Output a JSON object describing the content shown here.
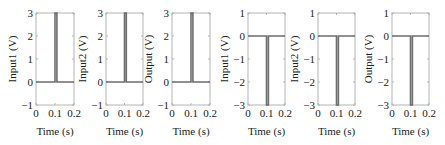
{
  "chart_data": [
    {
      "type": "line",
      "title": "",
      "xlabel": "Time (s)",
      "ylabel": "Input1 (V)",
      "xlim": [
        0,
        0.2
      ],
      "ylim": [
        -1,
        3
      ],
      "xticks": [
        "0",
        "0.1",
        "0.2"
      ],
      "yticks": [
        "-1",
        "0",
        "1",
        "2",
        "3"
      ],
      "x": [
        0,
        0.1,
        0.1,
        0.11,
        0.11,
        0.2
      ],
      "y": [
        0,
        0,
        3,
        3,
        0,
        0
      ],
      "grid": false,
      "box": {
        "left": 36,
        "right": 74
      }
    },
    {
      "type": "line",
      "title": "",
      "xlabel": "Time (s)",
      "ylabel": "Input2 (V)",
      "xlim": [
        0,
        0.2
      ],
      "ylim": [
        -1,
        3
      ],
      "xticks": [
        "0",
        "0.1",
        "0.2"
      ],
      "yticks": [
        "-1",
        "0",
        "1",
        "2",
        "3"
      ],
      "x": [
        0,
        0.1,
        0.1,
        0.11,
        0.11,
        0.2
      ],
      "y": [
        0,
        0,
        3,
        3,
        0,
        0
      ],
      "grid": false,
      "box": {
        "left": 106,
        "right": 143
      }
    },
    {
      "type": "line",
      "title": "",
      "xlabel": "Time (s)",
      "ylabel": "Output (V)",
      "xlim": [
        0,
        0.2
      ],
      "ylim": [
        -1,
        3
      ],
      "xticks": [
        "0",
        "0.1",
        "0.2"
      ],
      "yticks": [
        "-1",
        "0",
        "1",
        "2",
        "3"
      ],
      "x": [
        0,
        0.1,
        0.1,
        0.11,
        0.11,
        0.2
      ],
      "y": [
        0,
        0,
        3,
        3,
        0,
        0
      ],
      "grid": false,
      "box": {
        "left": 172,
        "right": 210
      }
    },
    {
      "type": "line",
      "title": "",
      "xlabel": "Time (s)",
      "ylabel": "Input1 (V)",
      "xlim": [
        0,
        0.2
      ],
      "ylim": [
        -3,
        1
      ],
      "xticks": [
        "0",
        "0.1",
        "0.2"
      ],
      "yticks": [
        "-3",
        "-2",
        "-1",
        "0",
        "1"
      ],
      "x": [
        0,
        0.1,
        0.1,
        0.11,
        0.11,
        0.2
      ],
      "y": [
        0,
        0,
        -3,
        -3,
        0,
        0
      ],
      "grid": false,
      "box": {
        "left": 248,
        "right": 285
      }
    },
    {
      "type": "line",
      "title": "",
      "xlabel": "Time (s)",
      "ylabel": "Input2 (V)",
      "xlim": [
        0,
        0.2
      ],
      "ylim": [
        -3,
        1
      ],
      "xticks": [
        "0",
        "0.1",
        "0.2"
      ],
      "yticks": [
        "-3",
        "-2",
        "-1",
        "0",
        "1"
      ],
      "x": [
        0,
        0.1,
        0.1,
        0.11,
        0.11,
        0.2
      ],
      "y": [
        0,
        0,
        -3,
        -3,
        0,
        0
      ],
      "grid": false,
      "box": {
        "left": 318,
        "right": 355
      }
    },
    {
      "type": "line",
      "title": "",
      "xlabel": "Time (s)",
      "ylabel": "Output (V)",
      "xlim": [
        0,
        0.2
      ],
      "ylim": [
        -3,
        1
      ],
      "xticks": [
        "0",
        "0.1",
        "0.2"
      ],
      "yticks": [
        "-3",
        "-2",
        "-1",
        "0",
        "1"
      ],
      "x": [
        0,
        0.1,
        0.1,
        0.11,
        0.11,
        0.2
      ],
      "y": [
        0,
        0,
        -3,
        -3,
        0,
        0
      ],
      "grid": false,
      "box": {
        "left": 392,
        "right": 429
      }
    }
  ],
  "style": {
    "line_color": "#6e6e6e",
    "axes_color": "#b4b4b4",
    "text_color": "#222222"
  }
}
